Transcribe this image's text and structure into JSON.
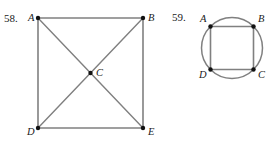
{
  "page": {
    "background_color": "#ffffff",
    "width": 273,
    "height": 142,
    "line_color": "#808080",
    "vertex_color": "#111111",
    "label_color": "#1a1a1a"
  },
  "figures": [
    {
      "id": "figure-58",
      "number_label": "58.",
      "number_pos": {
        "x": 4,
        "y": 22
      },
      "description": "square-with-both-diagonals",
      "shape": "quadrilateral",
      "vertices": [
        {
          "name": "A",
          "x": 38,
          "y": 18,
          "label_x": 28,
          "label_y": 21,
          "label": "A"
        },
        {
          "name": "B",
          "x": 143,
          "y": 18,
          "label_x": 148,
          "label_y": 21,
          "label": "B"
        },
        {
          "name": "E",
          "x": 143,
          "y": 128,
          "label_x": 148,
          "label_y": 135,
          "label": "E"
        },
        {
          "name": "D",
          "x": 38,
          "y": 128,
          "label_x": 27,
          "label_y": 135,
          "label": "D"
        },
        {
          "name": "C",
          "x": 90.5,
          "y": 73,
          "label_x": 96,
          "label_y": 76,
          "label": "C"
        }
      ],
      "edges": [
        {
          "from": "A",
          "to": "B",
          "kind": "side"
        },
        {
          "from": "B",
          "to": "E",
          "kind": "side"
        },
        {
          "from": "E",
          "to": "D",
          "kind": "side"
        },
        {
          "from": "D",
          "to": "A",
          "kind": "side"
        },
        {
          "from": "A",
          "to": "E",
          "kind": "diagonal"
        },
        {
          "from": "B",
          "to": "D",
          "kind": "diagonal"
        }
      ]
    },
    {
      "id": "figure-59",
      "number_label": "59.",
      "number_pos": {
        "x": 172,
        "y": 21
      },
      "description": "square-inscribed-in-circle",
      "shape": "square-in-circle",
      "circle": {
        "cx": 232,
        "cy": 48,
        "r": 30.5
      },
      "vertices": [
        {
          "name": "A",
          "x": 210.5,
          "y": 26.5,
          "label_x": 200,
          "label_y": 22,
          "label": "A"
        },
        {
          "name": "B",
          "x": 253.5,
          "y": 26.5,
          "label_x": 258,
          "label_y": 22,
          "label": "B"
        },
        {
          "name": "C",
          "x": 253.5,
          "y": 69.5,
          "label_x": 258,
          "label_y": 78,
          "label": "C"
        },
        {
          "name": "D",
          "x": 210.5,
          "y": 69.5,
          "label_x": 199,
          "label_y": 78,
          "label": "D"
        }
      ],
      "edges": [
        {
          "from": "A",
          "to": "B",
          "kind": "side"
        },
        {
          "from": "B",
          "to": "C",
          "kind": "side"
        },
        {
          "from": "C",
          "to": "D",
          "kind": "side"
        },
        {
          "from": "D",
          "to": "A",
          "kind": "side"
        }
      ]
    }
  ]
}
